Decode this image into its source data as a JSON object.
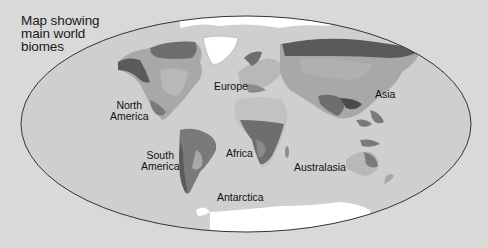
{
  "title": "Map showing\nmain world\nbiomes",
  "labels": {
    "north_america": "North\nAmerica",
    "europe": "Europe",
    "asia": "Asia",
    "africa": "Africa",
    "south_america": "South\nAmerica",
    "australasia": "Australasia",
    "antarctica": "Antarctica"
  },
  "colors": {
    "page_background": "#d9d9d9",
    "ocean": "#cfcfcf",
    "ice": "#ffffff",
    "tundra": "#6e6e6e",
    "forest_dark": "#5a5a5a",
    "grassland": "#a8a8a8",
    "desert": "#c2c2c2",
    "rainforest": "#7a7a7a",
    "outline": "#333333"
  }
}
